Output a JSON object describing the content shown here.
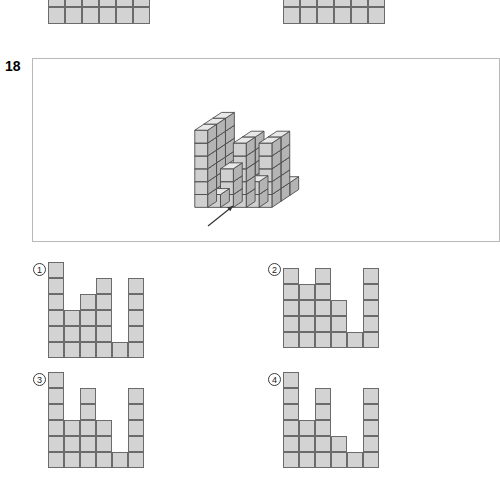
{
  "question": {
    "number": "18",
    "prompt_box": {
      "x": 32,
      "y": 58,
      "w": 468,
      "h": 184
    }
  },
  "top_cut_shapes": [
    {
      "name": "cut-shape-left",
      "x": 48,
      "y": -10,
      "cols": 6,
      "rows": 2,
      "cell": 17,
      "heights": [
        2,
        2,
        2,
        2,
        2,
        2
      ]
    },
    {
      "name": "cut-shape-right",
      "x": 283,
      "y": -10,
      "cols": 6,
      "rows": 2,
      "cell": 17,
      "heights": [
        2,
        2,
        2,
        2,
        2,
        2
      ]
    }
  ],
  "figure": {
    "name": "isometric-cube-stack",
    "cube": {
      "w": 13,
      "h": 13,
      "depth_x": 9,
      "depth_y": 6
    },
    "origin": {
      "x": 212,
      "y": 196
    },
    "columns": [
      {
        "gx": 0,
        "gy": 0,
        "height": 6
      },
      {
        "gx": 1,
        "gy": 0,
        "height": 1
      },
      {
        "gx": 2,
        "gy": 0,
        "height": 1
      },
      {
        "gx": 3,
        "gy": 0,
        "height": 1
      },
      {
        "gx": 4,
        "gy": 0,
        "height": 1
      },
      {
        "gx": 5,
        "gy": 0,
        "height": 1
      },
      {
        "gx": 0,
        "gy": 1,
        "height": 6
      },
      {
        "gx": 1,
        "gy": 1,
        "height": 1
      },
      {
        "gx": 2,
        "gy": 1,
        "height": 3
      },
      {
        "gx": 3,
        "gy": 1,
        "height": 5
      },
      {
        "gx": 4,
        "gy": 1,
        "height": 1
      },
      {
        "gx": 5,
        "gy": 1,
        "height": 5
      },
      {
        "gx": 0,
        "gy": 2,
        "height": 6
      },
      {
        "gx": 1,
        "gy": 2,
        "height": 1
      },
      {
        "gx": 2,
        "gy": 2,
        "height": 3
      },
      {
        "gx": 3,
        "gy": 2,
        "height": 5
      },
      {
        "gx": 4,
        "gy": 2,
        "height": 2
      },
      {
        "gx": 5,
        "gy": 2,
        "height": 5
      }
    ],
    "colors": {
      "top": "#e8e8e8",
      "left": "#d0d0d0",
      "right": "#b4b4b4",
      "edge": "#4a4a4a"
    }
  },
  "arrow": {
    "name": "pointer-arrow",
    "label": "",
    "x1": 208,
    "y1": 226,
    "x2": 233,
    "y2": 206
  },
  "options": [
    {
      "id": "1",
      "label": "①",
      "label_x": 33,
      "label_y": 263,
      "x": 48,
      "y": 262,
      "cols": 6,
      "rows": 6,
      "cell": 16,
      "heights": [
        6,
        3,
        4,
        5,
        1,
        5
      ]
    },
    {
      "id": "2",
      "label": "②",
      "label_x": 268,
      "label_y": 263,
      "x": 283,
      "y": 268,
      "cols": 6,
      "rows": 5,
      "cell": 16,
      "heights": [
        5,
        4,
        5,
        3,
        1,
        5
      ]
    },
    {
      "id": "3",
      "label": "③",
      "label_x": 33,
      "label_y": 373,
      "x": 48,
      "y": 372,
      "cols": 6,
      "rows": 6,
      "cell": 16,
      "heights": [
        6,
        3,
        5,
        3,
        1,
        5
      ]
    },
    {
      "id": "4",
      "label": "④",
      "label_x": 268,
      "label_y": 373,
      "x": 283,
      "y": 372,
      "cols": 6,
      "rows": 6,
      "cell": 16,
      "heights": [
        6,
        3,
        5,
        2,
        1,
        5
      ]
    }
  ],
  "colors": {
    "cell_fill": "#d3d3d3",
    "cell_stroke": "#6b6b6b",
    "frame_stroke": "#b8b8b8",
    "text": "#000000"
  }
}
